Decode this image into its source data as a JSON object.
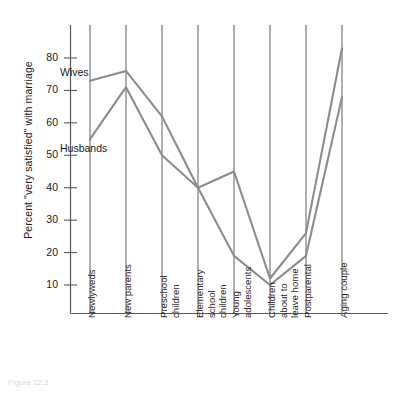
{
  "chart_data": {
    "type": "line",
    "title": "",
    "xlabel": "",
    "ylabel": "Percent \"very satisfied\" with marriage",
    "ylim": [
      0,
      87
    ],
    "yticks": [
      10,
      20,
      30,
      40,
      50,
      60,
      70,
      80
    ],
    "grid": "vertical category lines",
    "legend": "inline labels next to first data points",
    "categories": [
      "Newlyweds",
      "New parents",
      "Preschool children",
      "Elementary school children",
      "Young adolescents",
      "Children about to leave home",
      "Postparental",
      "Aging couple"
    ],
    "category_lines": [
      [
        "Newlyweds"
      ],
      [
        "New parents"
      ],
      [
        "Preschool",
        "children"
      ],
      [
        "Elementary",
        "school",
        "children"
      ],
      [
        "Young",
        "adolescents"
      ],
      [
        "Children",
        "about to",
        "leave home"
      ],
      [
        "Postparental"
      ],
      [
        "Aging couple"
      ]
    ],
    "series": [
      {
        "name": "Wives",
        "color": "#8c8c8c",
        "values": [
          73,
          76,
          62,
          40,
          45,
          12,
          26,
          83
        ]
      },
      {
        "name": "Husbands",
        "color": "#8c8c8c",
        "values": [
          55,
          71,
          50,
          40,
          19,
          10,
          19,
          68
        ]
      }
    ]
  },
  "axis": {
    "y_tick_labels": [
      "80",
      "70",
      "60",
      "50",
      "40",
      "30",
      "20",
      "10"
    ],
    "y_title": "Percent \"very satisfied\" with marriage"
  },
  "labels": {
    "wives": "Wives",
    "husbands": "Husbands"
  },
  "caption": {
    "text": "Figure 12.3"
  },
  "colors": {
    "line": "#8c8c8c",
    "axis": "#595959",
    "gridline": "#4d4d4d",
    "text": "#1a1a1a"
  }
}
